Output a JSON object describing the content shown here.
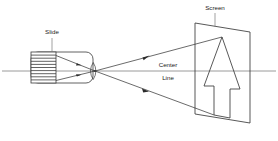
{
  "figure": {
    "kind": "optical-projection-diagram",
    "title_visible": false,
    "background_color": "#ffffff",
    "stroke_color": "#3a3a3a",
    "axis_color": "#8f8f8f",
    "text_color": "#1a1a1a"
  },
  "labels": {
    "slide": "Slide",
    "screen": "Screen",
    "center_line_1": "Center",
    "center_line_2": "Line"
  },
  "components": {
    "projector": {
      "name": "projector-body",
      "shape": "rounded-rectangle",
      "x": 31,
      "y": 52,
      "width": 62,
      "height": 31,
      "radius": 7
    },
    "slide_element": {
      "name": "slide-film-strip",
      "shape": "striped-rectangle",
      "x": 31,
      "y": 52,
      "width": 25,
      "height": 31,
      "stripe_count": 9,
      "fill": "#ffffff"
    },
    "lens": {
      "name": "lens-focal-point",
      "center_x": 95,
      "center_y": 71
    },
    "screen": {
      "name": "projection-screen",
      "shape": "parallelogram",
      "points": "195,23 250,32 250,123 195,114",
      "fill": "none"
    },
    "arrow_image": {
      "name": "projected-arrow",
      "shape": "up-arrow-outline",
      "points": "222,37 240,89 230,89 230,118 214,115 214,86 204,86"
    }
  },
  "rays": [
    {
      "name": "ray-upper",
      "x1": 56,
      "y1": 56,
      "x2": 95,
      "y2": 71,
      "marker_at": 0.58
    },
    {
      "name": "ray-lower",
      "x1": 56,
      "y1": 80,
      "x2": 95,
      "y2": 71,
      "marker_at": 0.58
    },
    {
      "name": "ray-upper-out",
      "x1": 95,
      "y1": 71,
      "x2": 222,
      "y2": 37,
      "marker_at": 0.42
    },
    {
      "name": "ray-lower-out",
      "x1": 95,
      "y1": 71,
      "x2": 214,
      "y2": 115,
      "marker_at": 0.42
    }
  ],
  "center_line": {
    "name": "optical-center-line",
    "x1": 2,
    "y1": 71,
    "x2": 276,
    "y2": 71
  },
  "leader_lines": [
    {
      "name": "leader-slide",
      "x1": 52,
      "y1": 38,
      "x2": 52,
      "y2": 52
    },
    {
      "name": "leader-screen",
      "x1": 215,
      "y1": 13,
      "x2": 215,
      "y2": 27
    }
  ],
  "label_positions": {
    "slide": {
      "x": 52,
      "y": 31
    },
    "screen": {
      "x": 215,
      "y": 7
    },
    "center": {
      "x": 168,
      "y": 65
    },
    "line": {
      "x": 168,
      "y": 78
    }
  }
}
